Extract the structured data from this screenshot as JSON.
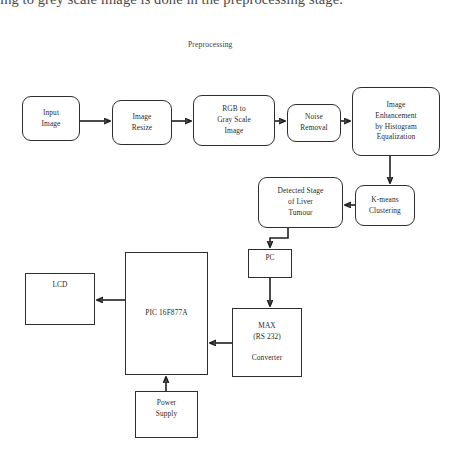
{
  "page": {
    "clipped_body_text": "ing to grey scale image is done in the preprocessing stage.",
    "section_label": "Preprocessing"
  },
  "diagram": {
    "type": "block-flow-diagram",
    "nodes": [
      {
        "id": "input-image",
        "label": "Input\nImage",
        "shape": "rounded",
        "x": 22,
        "y": 96,
        "w": 58,
        "h": 45
      },
      {
        "id": "image-resize",
        "label": "Image\nResize",
        "shape": "rounded",
        "x": 112,
        "y": 100,
        "w": 60,
        "h": 45
      },
      {
        "id": "rgb-to-gray",
        "label": "RGB to\nGray Scale\nImage",
        "shape": "rounded",
        "x": 193,
        "y": 95,
        "w": 82,
        "h": 51
      },
      {
        "id": "noise-removal",
        "label": "Noise\nRemoval",
        "shape": "rounded",
        "x": 287,
        "y": 104,
        "w": 54,
        "h": 38
      },
      {
        "id": "image-enhancement",
        "label": "Image\nEnhancement\nby Histogram\nEqualization",
        "shape": "rounded",
        "x": 352,
        "y": 87,
        "w": 88,
        "h": 69
      },
      {
        "id": "kmeans-clustering",
        "label": "K-means\nClustering",
        "shape": "rounded",
        "x": 355,
        "y": 185,
        "w": 60,
        "h": 41
      },
      {
        "id": "detected-stage",
        "label": "Detected Stage\nof Liver\nTumour",
        "shape": "rounded",
        "x": 258,
        "y": 177,
        "w": 85,
        "h": 51
      },
      {
        "id": "pc",
        "label": "PC",
        "shape": "sharp",
        "x": 248,
        "y": 249,
        "w": 44,
        "h": 29
      },
      {
        "id": "max-rs232",
        "label": "MAX\n(RS 232)\n\nConverter",
        "shape": "sharp",
        "x": 232,
        "y": 308,
        "w": 70,
        "h": 69
      },
      {
        "id": "pic-mcu",
        "label": "PIC 16F877A",
        "shape": "sharp",
        "x": 125,
        "y": 252,
        "w": 83,
        "h": 123
      },
      {
        "id": "lcd",
        "label": "LCD",
        "shape": "sharp",
        "x": 25,
        "y": 273,
        "w": 70,
        "h": 52,
        "align": "top"
      },
      {
        "id": "power-supply",
        "label": "Power\nSupply",
        "shape": "sharp",
        "x": 135,
        "y": 391,
        "w": 63,
        "h": 47
      }
    ],
    "edges": [
      {
        "id": "edge-input-to-resize",
        "from": "input-image",
        "to": "image-resize"
      },
      {
        "id": "edge-resize-to-rgb",
        "from": "image-resize",
        "to": "rgb-to-gray"
      },
      {
        "id": "edge-rgb-to-noise",
        "from": "rgb-to-gray",
        "to": "noise-removal"
      },
      {
        "id": "edge-noise-to-enhancement",
        "from": "noise-removal",
        "to": "image-enhancement"
      },
      {
        "id": "edge-enhancement-to-kmeans",
        "from": "image-enhancement",
        "to": "kmeans-clustering"
      },
      {
        "id": "edge-kmeans-to-detected",
        "from": "kmeans-clustering",
        "to": "detected-stage"
      },
      {
        "id": "edge-detected-to-pc",
        "from": "detected-stage",
        "to": "pc"
      },
      {
        "id": "edge-pc-to-max",
        "from": "pc",
        "to": "max-rs232"
      },
      {
        "id": "edge-max-to-pic",
        "from": "max-rs232",
        "to": "pic-mcu"
      },
      {
        "id": "edge-pic-to-lcd",
        "from": "pic-mcu",
        "to": "lcd"
      },
      {
        "id": "edge-power-to-pic",
        "from": "power-supply",
        "to": "pic-mcu"
      }
    ],
    "colors": {
      "stroke": "#2e2e2e",
      "fill": "#ffffff",
      "text": "#2b2b2b",
      "background": "#ffffff"
    }
  }
}
